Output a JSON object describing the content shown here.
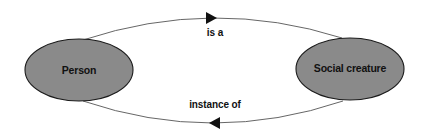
{
  "diagram": {
    "type": "concept-map",
    "colors": {
      "node_fill": "#8a8a8a",
      "node_stroke": "#1a1a1a",
      "edge_stroke": "#555555",
      "arrow_fill": "#111111",
      "text": "#111111",
      "background": "#ffffff"
    },
    "nodes": [
      {
        "id": "person",
        "label": "Person"
      },
      {
        "id": "social-creature",
        "label": "Social creature"
      }
    ],
    "edges": [
      {
        "from": "person",
        "to": "social-creature",
        "label": "is a",
        "direction": "right"
      },
      {
        "from": "social-creature",
        "to": "person",
        "label": "instance of",
        "direction": "left"
      }
    ]
  }
}
